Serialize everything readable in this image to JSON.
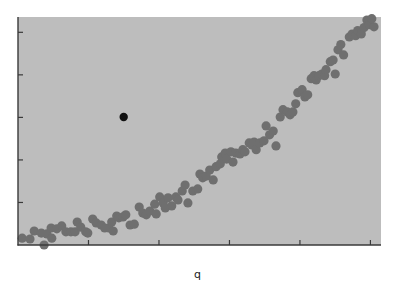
{
  "chart_data": {
    "type": "scatter",
    "title": "",
    "xlabel": "q",
    "ylabel": "",
    "xlim": [
      0,
      5.15
    ],
    "ylim": [
      0,
      5.36
    ],
    "x_ticks": [
      1,
      2,
      3,
      4,
      5
    ],
    "y_ticks": [
      1,
      2,
      3,
      4,
      5
    ],
    "x_tick_labels": [],
    "y_tick_labels": [],
    "grid": false,
    "legend": null,
    "background_color": "#bdbdbd",
    "series": [
      {
        "name": "observations",
        "color": "#6f6f6f",
        "marker_radius": 4.6,
        "points": [
          [
            0.06,
            0.16
          ],
          [
            0.17,
            0.14
          ],
          [
            0.23,
            0.33
          ],
          [
            0.33,
            0.28
          ],
          [
            0.37,
            0.0
          ],
          [
            0.41,
            0.26
          ],
          [
            0.48,
            0.16
          ],
          [
            0.47,
            0.4
          ],
          [
            0.55,
            0.38
          ],
          [
            0.62,
            0.45
          ],
          [
            0.68,
            0.31
          ],
          [
            0.75,
            0.31
          ],
          [
            0.81,
            0.31
          ],
          [
            0.84,
            0.54
          ],
          [
            0.89,
            0.42
          ],
          [
            0.96,
            0.31
          ],
          [
            0.99,
            0.28
          ],
          [
            1.06,
            0.61
          ],
          [
            1.11,
            0.52
          ],
          [
            1.18,
            0.47
          ],
          [
            1.23,
            0.4
          ],
          [
            1.29,
            0.4
          ],
          [
            1.33,
            0.54
          ],
          [
            1.35,
            0.33
          ],
          [
            1.4,
            0.68
          ],
          [
            1.43,
            0.64
          ],
          [
            1.49,
            0.66
          ],
          [
            1.53,
            0.71
          ],
          [
            1.59,
            0.47
          ],
          [
            1.65,
            0.49
          ],
          [
            1.72,
            0.89
          ],
          [
            1.77,
            0.75
          ],
          [
            1.82,
            0.71
          ],
          [
            1.87,
            0.8
          ],
          [
            1.94,
            0.96
          ],
          [
            1.96,
            0.73
          ],
          [
            2.01,
            1.13
          ],
          [
            2.06,
            0.99
          ],
          [
            2.09,
            0.87
          ],
          [
            2.13,
            1.11
          ],
          [
            2.18,
            0.92
          ],
          [
            2.24,
            1.13
          ],
          [
            2.27,
            1.06
          ],
          [
            2.33,
            1.27
          ],
          [
            2.37,
            1.41
          ],
          [
            2.41,
            0.99
          ],
          [
            2.48,
            1.27
          ],
          [
            2.55,
            1.32
          ],
          [
            2.58,
            1.67
          ],
          [
            2.62,
            1.58
          ],
          [
            2.67,
            1.62
          ],
          [
            2.72,
            1.76
          ],
          [
            2.77,
            1.53
          ],
          [
            2.81,
            1.84
          ],
          [
            2.87,
            1.91
          ],
          [
            2.89,
            2.07
          ],
          [
            2.94,
            2.16
          ],
          [
            2.96,
            2.02
          ],
          [
            3.02,
            2.19
          ],
          [
            3.05,
            1.95
          ],
          [
            3.09,
            2.16
          ],
          [
            3.15,
            2.14
          ],
          [
            3.19,
            2.24
          ],
          [
            3.22,
            2.19
          ],
          [
            3.28,
            2.4
          ],
          [
            3.32,
            2.35
          ],
          [
            3.35,
            2.42
          ],
          [
            3.38,
            2.24
          ],
          [
            3.43,
            2.4
          ],
          [
            3.49,
            2.45
          ],
          [
            3.52,
            2.8
          ],
          [
            3.57,
            2.59
          ],
          [
            3.62,
            2.68
          ],
          [
            3.66,
            2.33
          ],
          [
            3.72,
            3.01
          ],
          [
            3.76,
            3.18
          ],
          [
            3.82,
            3.13
          ],
          [
            3.86,
            3.06
          ],
          [
            3.9,
            3.13
          ],
          [
            3.94,
            3.32
          ],
          [
            3.97,
            3.58
          ],
          [
            4.03,
            3.65
          ],
          [
            4.07,
            3.48
          ],
          [
            4.11,
            3.53
          ],
          [
            4.16,
            3.91
          ],
          [
            4.2,
            3.98
          ],
          [
            4.23,
            3.88
          ],
          [
            4.27,
            3.98
          ],
          [
            4.31,
            4.02
          ],
          [
            4.35,
            3.98
          ],
          [
            4.37,
            4.12
          ],
          [
            4.43,
            4.31
          ],
          [
            4.47,
            4.35
          ],
          [
            4.5,
            4.02
          ],
          [
            4.54,
            4.59
          ],
          [
            4.58,
            4.71
          ],
          [
            4.62,
            4.47
          ],
          [
            4.7,
            4.89
          ],
          [
            4.74,
            4.96
          ],
          [
            4.79,
            4.92
          ],
          [
            4.82,
            5.04
          ],
          [
            4.87,
            4.96
          ],
          [
            4.91,
            5.11
          ],
          [
            4.95,
            5.29
          ],
          [
            4.99,
            5.18
          ],
          [
            5.05,
            5.13
          ],
          [
            5.02,
            5.32
          ]
        ]
      },
      {
        "name": "highlighted",
        "color": "#111111",
        "marker_radius": 4.2,
        "points": [
          [
            1.5,
            3.01
          ]
        ]
      }
    ]
  },
  "axes": {
    "x_label": "q",
    "axis_color": "#3a3a3a"
  }
}
